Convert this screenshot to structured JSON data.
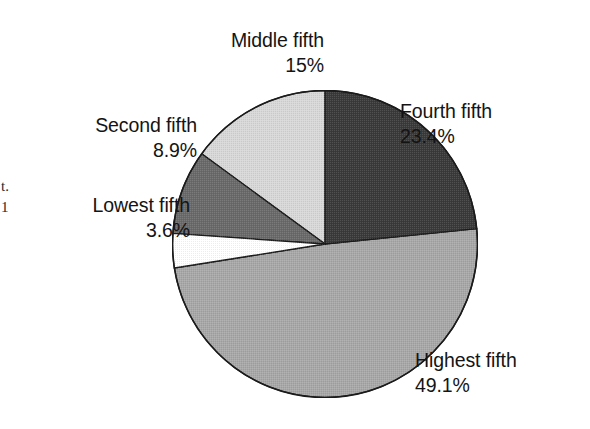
{
  "chart_data": {
    "type": "pie",
    "title": "",
    "subtitle": "",
    "xlabel": "",
    "ylabel": "",
    "grid": false,
    "legend_position": "callout-labels",
    "units": "percent",
    "start_angle_deg": 0,
    "direction": "clockwise",
    "categories": [
      "Fourth fifth",
      "Highest fifth",
      "Lowest fifth",
      "Second fifth",
      "Middle fifth"
    ],
    "values": [
      23.4,
      49.1,
      3.6,
      8.9,
      15
    ],
    "value_labels": [
      "23.4%",
      "49.1%",
      "3.6%",
      "8.9%",
      "15%"
    ],
    "colors": [
      "#3a3a3a",
      "#a8a8a8",
      "#ffffff",
      "#6a6a6a",
      "#d8d8d8"
    ],
    "slices": [
      {
        "name": "Fourth fifth",
        "value": 23.4,
        "value_label": "23.4%",
        "color": "#3a3a3a",
        "start_deg": 0,
        "end_deg": 84.24
      },
      {
        "name": "Highest fifth",
        "value": 49.1,
        "value_label": "49.1%",
        "color": "#a8a8a8",
        "start_deg": 84.24,
        "end_deg": 261.0
      },
      {
        "name": "Lowest fifth",
        "value": 3.6,
        "value_label": "3.6%",
        "color": "#ffffff",
        "start_deg": 261.0,
        "end_deg": 273.96
      },
      {
        "name": "Second fifth",
        "value": 8.9,
        "value_label": "8.9%",
        "color": "#6a6a6a",
        "start_deg": 273.96,
        "end_deg": 306.0
      },
      {
        "name": "Middle fifth",
        "value": 15,
        "value_label": "15%",
        "color": "#d8d8d8",
        "start_deg": 306.0,
        "end_deg": 360.0
      }
    ]
  },
  "labels": {
    "middle": {
      "name": "Middle fifth",
      "value": "15%"
    },
    "fourth": {
      "name": "Fourth fifth",
      "value": "23.4%"
    },
    "second": {
      "name": "Second fifth",
      "value": "8.9%"
    },
    "lowest": {
      "name": "Lowest fifth",
      "value": "3.6%"
    },
    "highest": {
      "name": "Highest fifth",
      "value": "49.1%"
    }
  },
  "edge_artifacts": {
    "top": "t.",
    "bottom": "1"
  }
}
